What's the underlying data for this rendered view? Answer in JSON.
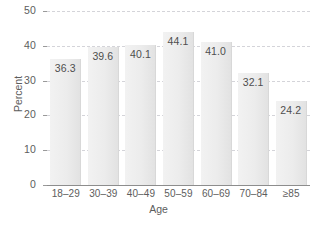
{
  "chart_data": {
    "type": "bar",
    "title": "",
    "subtitle": "",
    "xlabel": "Age",
    "ylabel": "Percent",
    "categories": [
      "18–29",
      "30–39",
      "40–49",
      "50–59",
      "60–69",
      "70–84",
      "≥85"
    ],
    "values": [
      36.3,
      39.6,
      40.1,
      44.1,
      41.0,
      32.1,
      24.2
    ],
    "value_labels": [
      "36.3",
      "39.6",
      "40.1",
      "44.1",
      "41.0",
      "32.1",
      "24.2"
    ],
    "ylim": [
      0,
      50
    ],
    "yticks": [
      0,
      10,
      20,
      30,
      40,
      50
    ],
    "ytick_labels": [
      "0",
      "10",
      "20",
      "30",
      "40",
      "50"
    ],
    "grid": "horizontal-dashed",
    "legend": "none",
    "annotations": "value labels placed inside top of each bar",
    "colors": {
      "bar_fill": "#ececec",
      "bar_edge": "#d8d8d8",
      "gridline": "#d2d2d8",
      "axis_line": "#8d8d8d",
      "text": "#5d5d5d",
      "background": "#ffffff"
    }
  }
}
